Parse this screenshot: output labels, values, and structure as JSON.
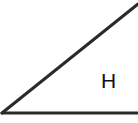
{
  "diagram": {
    "type": "geometry-triangle",
    "stroke_color": "#2a2a2a",
    "stroke_width": 3,
    "lines": [
      {
        "name": "hypotenuse",
        "x1": 2,
        "y1": 113,
        "x2": 138,
        "y2": 4
      },
      {
        "name": "base",
        "x1": 2,
        "y1": 113,
        "x2": 138,
        "y2": 113
      }
    ],
    "labels": [
      {
        "text": "H",
        "x": 101,
        "y": 70
      }
    ]
  }
}
